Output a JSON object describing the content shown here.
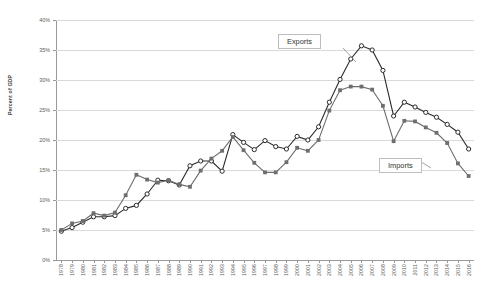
{
  "chart_data": {
    "type": "line",
    "title": "",
    "xlabel": "",
    "ylabel": "Percent of GDP",
    "ylim": [
      0,
      40
    ],
    "ytick_labels": [
      "0%",
      "5%",
      "10%",
      "15%",
      "20%",
      "25%",
      "30%",
      "35%",
      "40%"
    ],
    "ytick_values": [
      0,
      5,
      10,
      15,
      20,
      25,
      30,
      35,
      40
    ],
    "grid": true,
    "legend_position": "inside-callouts",
    "categories": [
      "1978",
      "1979",
      "1980",
      "1981",
      "1982",
      "1983",
      "1984",
      "1985",
      "1986",
      "1987",
      "1988",
      "1989",
      "1990",
      "1991",
      "1992",
      "1993",
      "1994",
      "1995",
      "1996",
      "1997",
      "1998",
      "1999",
      "2000",
      "2001",
      "2002",
      "2003",
      "2004",
      "2005",
      "2006",
      "2007",
      "2008",
      "2009",
      "2010",
      "2011",
      "2012",
      "2013",
      "2014",
      "2015",
      "2016"
    ],
    "series": [
      {
        "name": "Exports",
        "marker": "open-circle",
        "color": "#2b2b2b",
        "values": [
          4.8,
          5.4,
          6.3,
          7.2,
          7.2,
          7.4,
          8.6,
          9.1,
          11.0,
          13.3,
          13.2,
          12.5,
          15.7,
          16.5,
          16.5,
          14.8,
          20.9,
          19.6,
          18.4,
          19.9,
          18.9,
          18.5,
          20.6,
          20.0,
          22.2,
          26.3,
          30.1,
          33.5,
          35.7,
          35.0,
          31.6,
          24.0,
          26.3,
          25.5,
          24.6,
          23.8,
          22.6,
          21.3,
          18.5
        ]
      },
      {
        "name": "Imports",
        "marker": "filled-square",
        "color": "#6e6e6e",
        "values": [
          5.0,
          6.1,
          6.5,
          7.8,
          7.4,
          7.9,
          10.8,
          14.2,
          13.4,
          12.9,
          13.3,
          12.6,
          12.2,
          14.9,
          16.9,
          18.2,
          20.5,
          18.3,
          16.2,
          14.6,
          14.6,
          16.3,
          18.7,
          18.2,
          20.0,
          24.9,
          28.3,
          28.9,
          28.9,
          28.4,
          25.7,
          19.8,
          23.2,
          23.1,
          22.1,
          21.2,
          19.5,
          16.1,
          14.0
        ]
      }
    ],
    "annotations": [
      {
        "label": "Exports",
        "target_series": "Exports"
      },
      {
        "label": "Imports",
        "target_series": "Imports"
      }
    ]
  }
}
